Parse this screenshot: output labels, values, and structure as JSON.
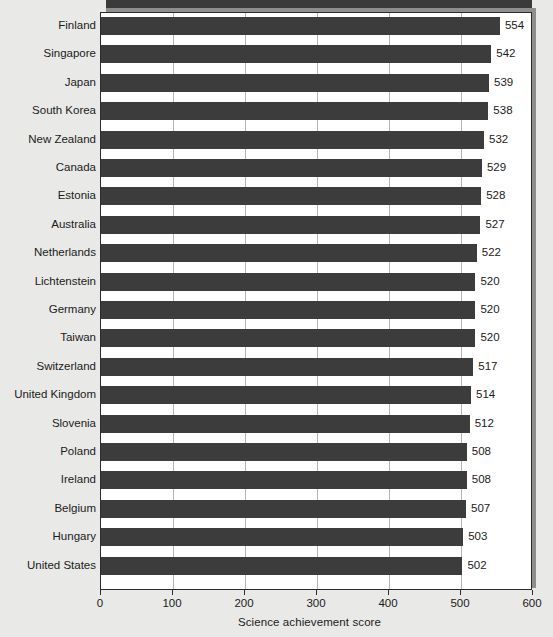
{
  "chart_data": {
    "type": "bar",
    "orientation": "horizontal",
    "title": "",
    "xlabel": "Science achievement score",
    "ylabel": "",
    "xlim": [
      0,
      600
    ],
    "xticks": [
      0,
      100,
      200,
      300,
      400,
      500,
      600
    ],
    "xtick_labels": [
      "0",
      "100",
      "200",
      "300",
      "400",
      "500",
      "600"
    ],
    "grid": true,
    "grid_axis": "x",
    "legend": false,
    "categories": [
      "Finland",
      "Singapore",
      "Japan",
      "South Korea",
      "New Zealand",
      "Canada",
      "Estonia",
      "Australia",
      "Netherlands",
      "Lichtenstein",
      "Germany",
      "Taiwan",
      "Switzerland",
      "United Kingdom",
      "Slovenia",
      "Poland",
      "Ireland",
      "Belgium",
      "Hungary",
      "United States"
    ],
    "values": [
      554,
      542,
      539,
      538,
      532,
      529,
      528,
      527,
      522,
      520,
      520,
      520,
      517,
      514,
      512,
      508,
      508,
      507,
      503,
      502
    ],
    "data_labels": [
      "554",
      "542",
      "539",
      "538",
      "532",
      "529",
      "528",
      "527",
      "522",
      "520",
      "520",
      "520",
      "517",
      "514",
      "512",
      "508",
      "508",
      "507",
      "503",
      "502"
    ],
    "colors": {
      "bar": "#3c3c3c",
      "plot_background": "#ffffff",
      "page_background": "#e9e9e7",
      "gridline": "#b6b6b6",
      "axis": "#2c2c2c",
      "text": "#1b1b1b",
      "shadow": "#8e8e8c"
    }
  }
}
